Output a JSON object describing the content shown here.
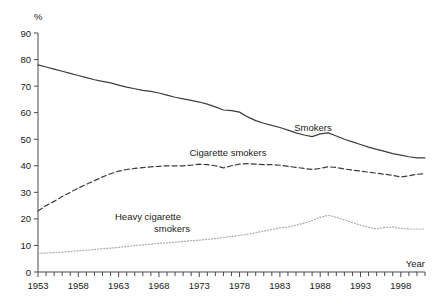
{
  "chart_data": {
    "type": "line",
    "title": "",
    "subtitle": "",
    "xlabel": "Year",
    "ylabel": "%",
    "xlim": [
      1953,
      2001
    ],
    "ylim": [
      0,
      90
    ],
    "grid": false,
    "legend_position": "inline-annotations",
    "y_ticks": [
      0,
      10,
      20,
      30,
      40,
      50,
      60,
      70,
      80,
      90
    ],
    "x_ticks": [
      1953,
      1958,
      1963,
      1968,
      1973,
      1978,
      1983,
      1988,
      1993,
      1998
    ],
    "x_minor_tick_step": 1,
    "x": [
      1953,
      1954,
      1955,
      1956,
      1957,
      1958,
      1959,
      1960,
      1961,
      1962,
      1963,
      1964,
      1965,
      1966,
      1967,
      1968,
      1969,
      1970,
      1971,
      1972,
      1973,
      1974,
      1975,
      1976,
      1977,
      1978,
      1979,
      1980,
      1981,
      1982,
      1983,
      1984,
      1985,
      1986,
      1987,
      1988,
      1989,
      1990,
      1991,
      1992,
      1993,
      1994,
      1995,
      1996,
      1997,
      1998,
      1999,
      2000,
      2001
    ],
    "series": [
      {
        "name": "Smokers",
        "style": "solid",
        "color": "#3c3c3c",
        "values": [
          78,
          77.2,
          76.4,
          75.6,
          74.8,
          74,
          73.2,
          72.4,
          71.8,
          71.2,
          70.4,
          69.6,
          69,
          68.4,
          68,
          67.4,
          66.6,
          65.8,
          65.2,
          64.6,
          64,
          63.2,
          62.2,
          61,
          60.8,
          60.2,
          58.4,
          57,
          56,
          55.2,
          54.4,
          53.4,
          52.4,
          51.6,
          51,
          52,
          52.4,
          51.2,
          50,
          49,
          48,
          47,
          46.2,
          45.4,
          44.6,
          44,
          43.4,
          43,
          43
        ]
      },
      {
        "name": "Cigarette smokers",
        "style": "dashed",
        "color": "#3c3c3c",
        "values": [
          23,
          25,
          26.6,
          28.4,
          30,
          31.6,
          33,
          34.4,
          35.8,
          37,
          38,
          38.6,
          39,
          39.3,
          39.6,
          39.8,
          40,
          40,
          40,
          40.2,
          40.6,
          40.4,
          40,
          39.2,
          40,
          40.6,
          40.8,
          40.6,
          40.4,
          40.4,
          40.2,
          39.8,
          39.4,
          39,
          38.6,
          39,
          39.6,
          39.4,
          38.8,
          38.4,
          38,
          37.6,
          37.2,
          36.8,
          36.4,
          35.8,
          36.2,
          36.8,
          37
        ]
      },
      {
        "name": "Heavy cigarette smokers",
        "style": "dotted",
        "color": "#a8a8a8",
        "values": [
          7,
          7.1,
          7.3,
          7.5,
          7.7,
          8,
          8.2,
          8.5,
          8.8,
          9,
          9.3,
          9.6,
          10,
          10.2,
          10.5,
          10.8,
          11,
          11.2,
          11.5,
          11.8,
          12,
          12.3,
          12.6,
          13,
          13.4,
          13.8,
          14.2,
          14.8,
          15.4,
          16,
          16.6,
          17,
          17.6,
          18.4,
          19.4,
          20.6,
          21.4,
          20.6,
          19.6,
          18.6,
          17.6,
          16.8,
          16.2,
          16.8,
          17,
          16.4,
          16.2,
          16.2,
          16.2
        ]
      }
    ],
    "annotations": [
      {
        "text": "Smokers",
        "x_px": 313,
        "y_px": 131
      },
      {
        "text": "Cigarette smokers",
        "x_px": 228,
        "y_px": 156
      },
      {
        "text": "Heavy cigarette",
        "x_px": 148,
        "y_px": 220
      },
      {
        "text": "smokers",
        "x_px": 172,
        "y_px": 232
      }
    ]
  },
  "axis": {
    "y_unit": "%",
    "x_title": "Year"
  }
}
